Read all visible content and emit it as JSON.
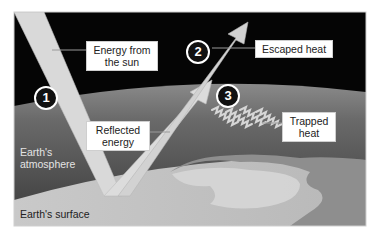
{
  "diagram": {
    "type": "greenhouse-effect",
    "colors": {
      "space": "#050505",
      "atmosphere": "#5a5a5a",
      "surface": "#cfcfcf",
      "land": "#8e8e8e",
      "arrow": "#d8d8d8",
      "label_bg": "#ffffff"
    },
    "steps": [
      {
        "number": "1",
        "callout": "Energy from the sun"
      },
      {
        "number": "2",
        "callout": "Escaped heat"
      },
      {
        "number": "3",
        "callout": "Trapped heat"
      }
    ],
    "labels": {
      "energy_from_sun_line1": "Energy from",
      "energy_from_sun_line2": "the sun",
      "escaped_heat": "Escaped heat",
      "reflected_line1": "Reflected",
      "reflected_line2": "energy",
      "trapped_line1": "Trapped",
      "trapped_line2": "heat",
      "atmosphere_line1": "Earth's",
      "atmosphere_line2": "atmosphere",
      "surface": "Earth's surface"
    },
    "markers": {
      "one": "1",
      "two": "2",
      "three": "3"
    }
  }
}
